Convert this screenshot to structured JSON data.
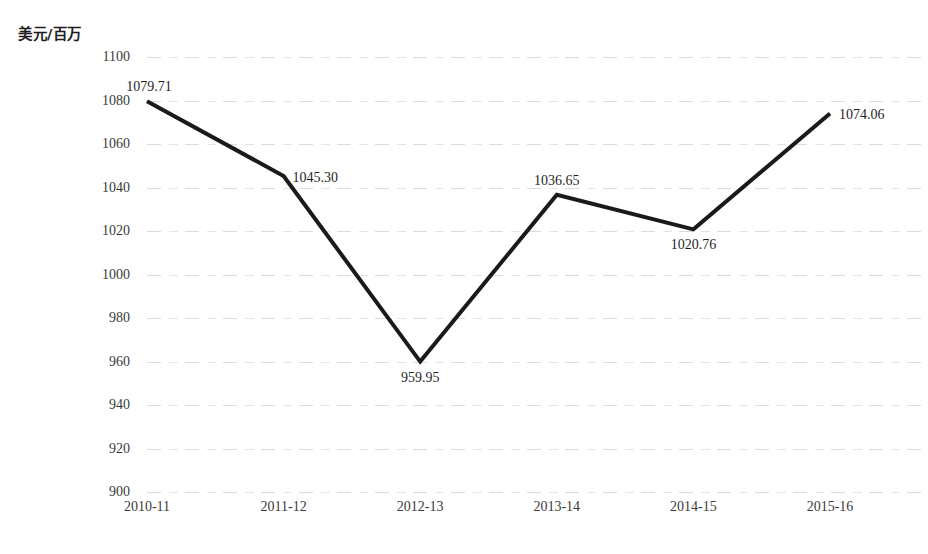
{
  "chart_data": {
    "type": "line",
    "title": "",
    "subtitle": "",
    "xlabel": "",
    "ylabel": "美元/百万",
    "categories": [
      "2010-11",
      "2011-12",
      "2012-13",
      "2013-14",
      "2014-15",
      "2015-16"
    ],
    "values": [
      1079.71,
      1045.3,
      959.95,
      1036.65,
      1020.76,
      1074.06
    ],
    "point_labels": [
      "1079.71",
      "1045.30",
      "959.95",
      "1036.65",
      "1020.76",
      "1074.06"
    ],
    "series": [
      {
        "name": "",
        "values": [
          1079.71,
          1045.3,
          959.95,
          1036.65,
          1020.76,
          1074.06
        ]
      }
    ],
    "ylim": [
      900,
      1100
    ],
    "ytick_step": 20,
    "ytick_labels": [
      "1100",
      "1080",
      "1060",
      "1040",
      "1020",
      "1000",
      "980",
      "960",
      "940",
      "920",
      "900"
    ],
    "ytick_values": [
      1100,
      1080,
      1060,
      1040,
      1020,
      1000,
      980,
      960,
      940,
      920,
      900
    ],
    "grid": true,
    "grid_axis": "y",
    "legend": false,
    "legend_position": "none",
    "line_color": "#1a1a1a",
    "line_width": 4,
    "markers": false,
    "background_color": "#ffffff",
    "grid_color": "#a6a6ac",
    "label_placement": [
      "above-left",
      "right",
      "below",
      "above",
      "below",
      "right"
    ]
  },
  "axis": {
    "y_caption": "美元/百万"
  }
}
